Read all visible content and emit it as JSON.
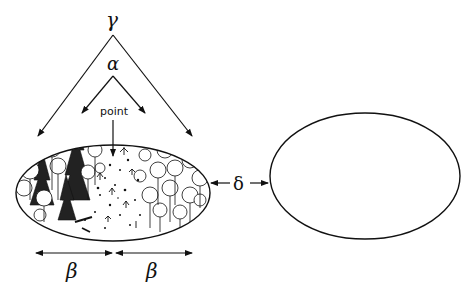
{
  "diagram": {
    "labels": {
      "gamma": "γ",
      "alpha": "α",
      "point": "point",
      "delta": "δ",
      "beta_left": "β",
      "beta_right": "β"
    },
    "shapes": {
      "left_ellipse": {
        "description": "forest habitat with trees and clearing",
        "filled_with_illustration": true
      },
      "right_ellipse": {
        "description": "empty habitat",
        "filled_with_illustration": false
      }
    },
    "colors": {
      "stroke": "#111111",
      "background": "#ffffff"
    }
  }
}
